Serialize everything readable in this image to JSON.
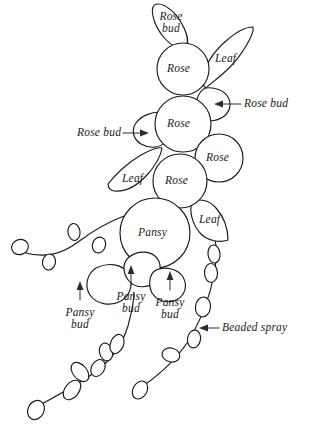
{
  "diagram": {
    "background_color": "#ffffff",
    "line_color": "#1a1a1a",
    "text_color": "#1a1a1a",
    "width": 316,
    "height": 432
  },
  "labels": {
    "rose_bud_top": "Rose bud",
    "rose_top": "Rose",
    "leaf_upper": "Leaf",
    "rose_bud_right": "Rose bud",
    "rose_middle": "Rose",
    "rose_bud_left": "Rose bud",
    "rose_right": "Rose",
    "leaf_left": "Leaf",
    "rose_lower": "Rose",
    "pansy": "Pansy",
    "leaf_right": "Leaf",
    "pansy_bud_left": "Pansy bud",
    "pansy_bud_middle": "Pansy bud",
    "pansy_bud_right": "Pansy bud",
    "beaded_spray": "Beaded spray"
  },
  "components": [
    {
      "name": "rose-bud-top",
      "label": "Rose bud",
      "type": "bud",
      "labeled_inside": true
    },
    {
      "name": "rose-top",
      "label": "Rose",
      "type": "flower",
      "labeled_inside": true
    },
    {
      "name": "leaf-upper",
      "label": "Leaf",
      "type": "leaf",
      "labeled_inside": true
    },
    {
      "name": "rose-bud-right",
      "label": "Rose bud",
      "type": "bud",
      "labeled_inside": false
    },
    {
      "name": "rose-middle",
      "label": "Rose",
      "type": "flower",
      "labeled_inside": true
    },
    {
      "name": "rose-bud-left",
      "label": "Rose bud",
      "type": "bud",
      "labeled_inside": false
    },
    {
      "name": "rose-right",
      "label": "Rose",
      "type": "flower",
      "labeled_inside": true
    },
    {
      "name": "leaf-left",
      "label": "Leaf",
      "type": "leaf",
      "labeled_inside": true
    },
    {
      "name": "rose-lower",
      "label": "Rose",
      "type": "flower",
      "labeled_inside": true
    },
    {
      "name": "pansy",
      "label": "Pansy",
      "type": "flower",
      "labeled_inside": true
    },
    {
      "name": "leaf-right",
      "label": "Leaf",
      "type": "leaf",
      "labeled_inside": true
    },
    {
      "name": "pansy-bud-left",
      "label": "Pansy bud",
      "type": "bud",
      "labeled_inside": false
    },
    {
      "name": "pansy-bud-middle",
      "label": "Pansy bud",
      "type": "bud",
      "labeled_inside": false
    },
    {
      "name": "pansy-bud-right",
      "label": "Pansy bud",
      "type": "bud",
      "labeled_inside": false
    },
    {
      "name": "beaded-spray",
      "label": "Beaded spray",
      "type": "spray",
      "labeled_inside": false
    }
  ]
}
